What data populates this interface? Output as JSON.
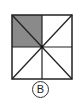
{
  "figure": {
    "type": "square-divided-into-triangles",
    "square": {
      "x": 12,
      "y": 15,
      "width": 60,
      "height": 64
    },
    "center": {
      "x": 42,
      "y": 47
    },
    "divisions": [
      "vertical-center-line",
      "horizontal-center-line",
      "diagonal-tl-br",
      "diagonal-tr-bl"
    ],
    "total_parts": 8,
    "shaded_parts": 2,
    "shaded_region": "top-left-quadrant",
    "colors": {
      "shade": "#8a8a8a",
      "stroke": "#222222",
      "background": "#ffffff"
    }
  },
  "label": {
    "text": "B"
  }
}
